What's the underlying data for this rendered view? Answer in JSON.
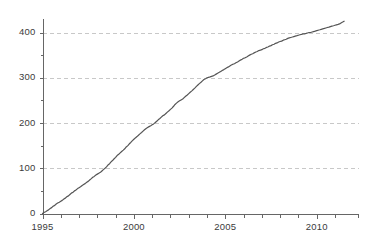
{
  "chart_data": {
    "type": "line",
    "title": "",
    "subtitle": "",
    "xlabel": "",
    "ylabel": "",
    "xlim": [
      1995.0,
      1995.0
    ],
    "ylim": [
      0,
      430
    ],
    "grid": "horizontal-dashed",
    "legend": "none",
    "axis": {
      "x_major_ticks": [
        1995,
        2000,
        2005,
        2010
      ],
      "x_major_tick_labels": [
        "1995",
        "2000",
        "2005",
        "2010"
      ],
      "x_minor_ticks": [
        1996,
        1997,
        1998,
        1999,
        2001,
        2002,
        2003,
        2004,
        2006,
        2007,
        2008,
        2009,
        2011
      ],
      "y_major_ticks": [
        0,
        100,
        200,
        300,
        400
      ],
      "y_major_tick_labels": [
        "0",
        "100",
        "200",
        "300",
        "400"
      ],
      "y_minor_ticks": [
        50,
        150,
        250,
        350
      ],
      "x_axis_start": 1995.0,
      "x_axis_end": 2012.3,
      "y_axis_start": 0,
      "y_axis_end": 430
    },
    "gridlines_y": [
      100,
      200,
      300,
      400
    ],
    "colors": {
      "line": "#555555",
      "gridline": "#c8c8c8",
      "axis": "#666666",
      "tick_label": "#3b3b3b",
      "background": "#ffffff"
    },
    "series": [
      {
        "name": "cumulative total",
        "x": [
          1995.0,
          1995.08,
          1995.17,
          1995.25,
          1995.33,
          1995.42,
          1995.5,
          1995.58,
          1995.67,
          1995.75,
          1995.83,
          1995.92,
          1996.0,
          1996.08,
          1996.17,
          1996.25,
          1996.33,
          1996.42,
          1996.5,
          1996.58,
          1996.67,
          1996.75,
          1996.83,
          1996.92,
          1997.0,
          1997.08,
          1997.17,
          1997.25,
          1997.33,
          1997.42,
          1997.5,
          1997.58,
          1997.67,
          1997.75,
          1997.83,
          1997.92,
          1998.0,
          1998.08,
          1998.17,
          1998.25,
          1998.33,
          1998.42,
          1998.5,
          1998.58,
          1998.67,
          1998.75,
          1998.83,
          1998.92,
          1999.0,
          1999.08,
          1999.17,
          1999.25,
          1999.33,
          1999.42,
          1999.5,
          1999.58,
          1999.67,
          1999.75,
          1999.83,
          1999.92,
          2000.0,
          2000.08,
          2000.17,
          2000.25,
          2000.33,
          2000.42,
          2000.5,
          2000.58,
          2000.67,
          2000.75,
          2000.83,
          2000.92,
          2001.0,
          2001.08,
          2001.17,
          2001.25,
          2001.33,
          2001.42,
          2001.5,
          2001.58,
          2001.67,
          2001.75,
          2001.83,
          2001.92,
          2002.0,
          2002.08,
          2002.17,
          2002.25,
          2002.33,
          2002.42,
          2002.5,
          2002.58,
          2002.67,
          2002.75,
          2002.83,
          2002.92,
          2003.0,
          2003.08,
          2003.17,
          2003.25,
          2003.33,
          2003.42,
          2003.5,
          2003.58,
          2003.67,
          2003.75,
          2003.83,
          2003.92,
          2004.0,
          2004.08,
          2004.17,
          2004.25,
          2004.33,
          2004.42,
          2004.5,
          2004.58,
          2004.67,
          2004.75,
          2004.83,
          2004.92,
          2005.0,
          2005.08,
          2005.17,
          2005.25,
          2005.33,
          2005.42,
          2005.5,
          2005.58,
          2005.67,
          2005.75,
          2005.83,
          2005.92,
          2006.0,
          2006.08,
          2006.17,
          2006.25,
          2006.33,
          2006.42,
          2006.5,
          2006.58,
          2006.67,
          2006.75,
          2006.83,
          2006.92,
          2007.0,
          2007.08,
          2007.17,
          2007.25,
          2007.33,
          2007.42,
          2007.5,
          2007.58,
          2007.67,
          2007.75,
          2007.83,
          2007.92,
          2008.0,
          2008.08,
          2008.17,
          2008.25,
          2008.33,
          2008.42,
          2008.5,
          2008.58,
          2008.67,
          2008.75,
          2008.83,
          2008.92,
          2009.0,
          2009.08,
          2009.17,
          2009.25,
          2009.33,
          2009.42,
          2009.5,
          2009.58,
          2009.67,
          2009.75,
          2009.83,
          2009.92,
          2010.0,
          2010.08,
          2010.17,
          2010.25,
          2010.33,
          2010.42,
          2010.5,
          2010.58,
          2010.67,
          2010.75,
          2010.83,
          2010.92,
          2011.0,
          2011.08,
          2011.17,
          2011.25,
          2011.33,
          2011.42,
          2011.5
        ],
        "values": [
          0,
          2,
          4,
          6,
          8,
          11,
          13,
          16,
          18,
          21,
          23,
          25,
          27,
          29,
          32,
          34,
          37,
          39,
          42,
          45,
          47,
          50,
          52,
          55,
          57,
          59,
          62,
          64,
          66,
          69,
          71,
          74,
          77,
          80,
          82,
          85,
          87,
          89,
          91,
          94,
          97,
          100,
          103,
          107,
          110,
          114,
          117,
          121,
          124,
          128,
          131,
          134,
          137,
          140,
          143,
          147,
          150,
          154,
          157,
          161,
          164,
          167,
          170,
          173,
          176,
          179,
          182,
          185,
          188,
          190,
          192,
          194,
          196,
          198,
          201,
          204,
          207,
          210,
          213,
          216,
          218,
          221,
          224,
          227,
          230,
          233,
          237,
          241,
          244,
          247,
          249,
          251,
          253,
          256,
          259,
          262,
          265,
          268,
          271,
          274,
          277,
          281,
          284,
          287,
          290,
          293,
          296,
          298,
          300,
          301,
          302,
          303,
          304,
          306,
          308,
          310,
          312,
          314,
          316,
          318,
          320,
          322,
          324,
          326,
          328,
          330,
          331,
          333,
          335,
          337,
          339,
          341,
          343,
          344,
          346,
          348,
          350,
          352,
          353,
          355,
          357,
          358,
          360,
          361,
          362,
          364,
          365,
          367,
          368,
          370,
          371,
          373,
          374,
          376,
          377,
          379,
          380,
          381,
          383,
          384,
          385,
          387,
          388,
          389,
          390,
          391,
          392,
          393,
          394,
          395,
          396,
          397,
          397,
          398,
          399,
          400,
          400,
          401,
          402,
          403,
          404,
          405,
          406,
          407,
          408,
          409,
          410,
          411,
          412,
          413,
          414,
          415,
          416,
          417,
          418,
          419,
          421,
          423,
          425
        ]
      }
    ],
    "annotations": [],
    "notes": {
      "shape": "monotonically increasing cumulative curve, steep and near-linear from 1995 to 2004, then gradually flattening after 2004",
      "final_value": 425,
      "start_value": 0
    }
  },
  "axis_labels": {
    "y": [
      "400",
      "300",
      "200",
      "100",
      "0"
    ],
    "x": [
      "1995",
      "2000",
      "2005",
      "2010"
    ]
  }
}
